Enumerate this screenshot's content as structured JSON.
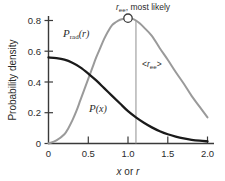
{
  "figure": {
    "background_color": "#ffffff",
    "width": 225,
    "height": 181
  },
  "chart_data": {
    "type": "line",
    "title": "",
    "xlabel": "x or r",
    "ylabel": "Probability density",
    "xlim": [
      0,
      2.1
    ],
    "ylim": [
      0,
      0.88
    ],
    "xticks": [
      "0",
      "0.5",
      "1.0",
      "1.5",
      "2.0"
    ],
    "xtick_values": [
      0,
      0.5,
      1.0,
      1.5,
      2.0
    ],
    "yticks": [
      "0",
      "0.2",
      "0.4",
      "0.6",
      "0.8"
    ],
    "ytick_values": [
      0,
      0.2,
      0.4,
      0.6,
      0.8
    ],
    "grid": false,
    "legend_position": "inline-curve-labels",
    "series": [
      {
        "name": "P_rad(r)",
        "label_text": "rad",
        "label_prefix": "P",
        "label_suffix": "(r)",
        "color": "#9a9a9a",
        "x": [
          0.0,
          0.1,
          0.2,
          0.25,
          0.3,
          0.35,
          0.4,
          0.45,
          0.5,
          0.55,
          0.6,
          0.65,
          0.7,
          0.75,
          0.8,
          0.85,
          0.9,
          0.95,
          1.0,
          1.05,
          1.1,
          1.15,
          1.2,
          1.3,
          1.4,
          1.5,
          1.6,
          1.7,
          1.8,
          1.9,
          2.0
        ],
        "values": [
          0.0,
          0.02,
          0.06,
          0.1,
          0.15,
          0.21,
          0.28,
          0.35,
          0.42,
          0.49,
          0.56,
          0.62,
          0.68,
          0.73,
          0.77,
          0.79,
          0.805,
          0.812,
          0.815,
          0.812,
          0.8,
          0.78,
          0.755,
          0.7,
          0.62,
          0.545,
          0.465,
          0.39,
          0.31,
          0.24,
          0.17
        ]
      },
      {
        "name": "P(x)",
        "label_prefix": "P",
        "label_suffix": "(x)",
        "color": "#1a1a1a",
        "x": [
          0.0,
          0.1,
          0.2,
          0.3,
          0.4,
          0.5,
          0.6,
          0.7,
          0.8,
          0.9,
          1.0,
          1.1,
          1.2,
          1.3,
          1.4,
          1.5,
          1.6,
          1.7,
          1.8,
          1.9,
          2.0
        ],
        "values": [
          0.56,
          0.555,
          0.545,
          0.525,
          0.495,
          0.455,
          0.41,
          0.36,
          0.31,
          0.26,
          0.21,
          0.17,
          0.135,
          0.105,
          0.08,
          0.06,
          0.045,
          0.033,
          0.024,
          0.018,
          0.014
        ]
      }
    ],
    "annotations": [
      {
        "name": "most-likely-marker",
        "text": "r_ee, most likely",
        "text_main": ", most likely",
        "text_var": "r",
        "text_sub": "ee",
        "marker": "open-circle",
        "x": 1.0,
        "y": 0.815
      },
      {
        "name": "mean-end-to-end-distance",
        "text": "<r_ee>",
        "text_open": "<",
        "text_var": "r",
        "text_sub": "ee",
        "text_close": ">",
        "marker": "vertical-line",
        "x": 1.1,
        "y_top": 0.8,
        "y_bottom": 0.0
      }
    ]
  },
  "labels": {
    "y_axis_title": "Probability density",
    "x_axis_title_part1": "x",
    "x_axis_title_part2": " or ",
    "x_axis_title_part3": "r",
    "curve_rad_p": "P",
    "curve_rad_sub": "rad",
    "curve_rad_arg": "(r)",
    "curve_px_p": "P",
    "curve_px_arg": "(x)",
    "annot_most_likely_var": "r",
    "annot_most_likely_sub": "ee",
    "annot_most_likely_rest": ", most likely",
    "annot_mean_open": "<",
    "annot_mean_var": "r",
    "annot_mean_sub": "ee",
    "annot_mean_close": ">"
  },
  "ticks": {
    "x": [
      "0",
      "0.5",
      "1.0",
      "1.5",
      "2.0"
    ],
    "y": [
      "0",
      "0.2",
      "0.4",
      "0.6",
      "0.8"
    ]
  },
  "colors": {
    "curve_rad": "#9a9a9a",
    "curve_px": "#1a1a1a",
    "axis": "#3a3a3a",
    "text": "#2b2b2b",
    "background": "#ffffff"
  }
}
